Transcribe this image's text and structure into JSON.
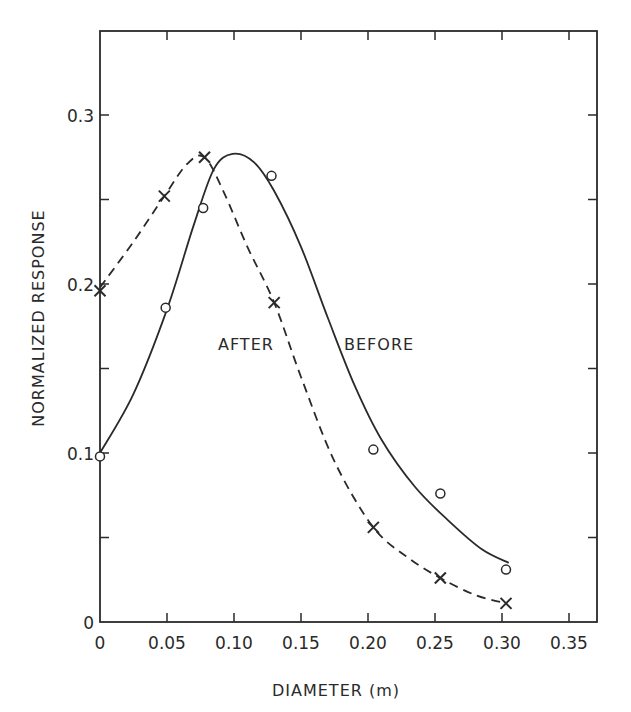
{
  "chart_data": {
    "type": "line",
    "title": "",
    "xlabel": "DIAMETER (m)",
    "ylabel": "NORMALIZED RESPONSE",
    "xlim": [
      0,
      0.37
    ],
    "ylim": [
      0,
      0.35
    ],
    "xticks": [
      0,
      0.05,
      0.1,
      0.15,
      0.2,
      0.25,
      0.3,
      0.35
    ],
    "xtick_labels": [
      "0",
      "0.05",
      "0.10",
      "0.15",
      "0.20",
      "0.25",
      "0.30",
      "0.35"
    ],
    "yticks": [
      0,
      0.1,
      0.2,
      0.3
    ],
    "ytick_labels": [
      "0",
      "0.1",
      "0.2",
      "0.3"
    ],
    "minor_yticks": [
      0.05,
      0.15,
      0.25
    ],
    "grid": false,
    "legend": null,
    "series": [
      {
        "name": "BEFORE",
        "marker": "circle",
        "line_style": "solid",
        "points": [
          {
            "x": 0.0,
            "y": 0.098
          },
          {
            "x": 0.049,
            "y": 0.186
          },
          {
            "x": 0.077,
            "y": 0.245
          },
          {
            "x": 0.128,
            "y": 0.264
          },
          {
            "x": 0.204,
            "y": 0.102
          },
          {
            "x": 0.254,
            "y": 0.076
          },
          {
            "x": 0.303,
            "y": 0.031
          }
        ],
        "fit_curve": [
          {
            "x": 0.0,
            "y": 0.1
          },
          {
            "x": 0.025,
            "y": 0.135
          },
          {
            "x": 0.05,
            "y": 0.185
          },
          {
            "x": 0.07,
            "y": 0.235
          },
          {
            "x": 0.085,
            "y": 0.268
          },
          {
            "x": 0.099,
            "y": 0.277
          },
          {
            "x": 0.115,
            "y": 0.272
          },
          {
            "x": 0.13,
            "y": 0.255
          },
          {
            "x": 0.15,
            "y": 0.222
          },
          {
            "x": 0.17,
            "y": 0.18
          },
          {
            "x": 0.19,
            "y": 0.14
          },
          {
            "x": 0.21,
            "y": 0.108
          },
          {
            "x": 0.235,
            "y": 0.08
          },
          {
            "x": 0.26,
            "y": 0.06
          },
          {
            "x": 0.285,
            "y": 0.043
          },
          {
            "x": 0.305,
            "y": 0.035
          }
        ]
      },
      {
        "name": "AFTER",
        "marker": "x",
        "line_style": "dashed",
        "points": [
          {
            "x": 0.0,
            "y": 0.196
          },
          {
            "x": 0.048,
            "y": 0.252
          },
          {
            "x": 0.078,
            "y": 0.275
          },
          {
            "x": 0.13,
            "y": 0.189
          },
          {
            "x": 0.204,
            "y": 0.056
          },
          {
            "x": 0.254,
            "y": 0.026
          },
          {
            "x": 0.303,
            "y": 0.011
          }
        ],
        "fit_curve": [
          {
            "x": 0.0,
            "y": 0.198
          },
          {
            "x": 0.025,
            "y": 0.225
          },
          {
            "x": 0.048,
            "y": 0.252
          },
          {
            "x": 0.065,
            "y": 0.271
          },
          {
            "x": 0.078,
            "y": 0.275
          },
          {
            "x": 0.092,
            "y": 0.255
          },
          {
            "x": 0.11,
            "y": 0.222
          },
          {
            "x": 0.13,
            "y": 0.189
          },
          {
            "x": 0.15,
            "y": 0.145
          },
          {
            "x": 0.175,
            "y": 0.095
          },
          {
            "x": 0.204,
            "y": 0.056
          },
          {
            "x": 0.23,
            "y": 0.038
          },
          {
            "x": 0.254,
            "y": 0.026
          },
          {
            "x": 0.28,
            "y": 0.016
          },
          {
            "x": 0.303,
            "y": 0.011
          }
        ]
      }
    ],
    "annotations": [
      {
        "text": "AFTER",
        "x": 0.172,
        "y": 0.165
      },
      {
        "text": "BEFORE",
        "x": 0.182,
        "y": 0.165
      }
    ]
  },
  "labels": {
    "xlabel": "DIAMETER (m)",
    "ylabel": "NORMALIZED RESPONSE",
    "after": "AFTER",
    "before": "BEFORE"
  },
  "colors": {
    "ink": "#2a2a2a",
    "background": "#ffffff"
  }
}
